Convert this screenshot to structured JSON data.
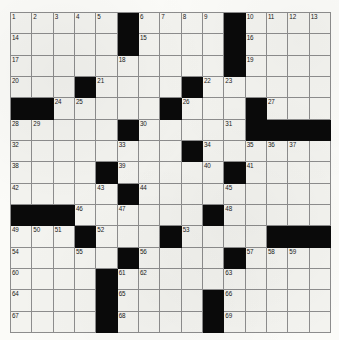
{
  "puzzle": {
    "type": "crossword-grid",
    "rows": 15,
    "cols": 15,
    "colors": {
      "block": "#0a0a0a",
      "cell": "#f3f3ef",
      "rule": "#8d8d8d",
      "paper": "#fbfbf8",
      "number_text": "#1a1a1a"
    },
    "blocks": [
      [
        0,
        5
      ],
      [
        0,
        10
      ],
      [
        1,
        5
      ],
      [
        1,
        10
      ],
      [
        2,
        10
      ],
      [
        3,
        3
      ],
      [
        3,
        8
      ],
      [
        4,
        0
      ],
      [
        4,
        1
      ],
      [
        4,
        7
      ],
      [
        4,
        11
      ],
      [
        5,
        5
      ],
      [
        5,
        11
      ],
      [
        5,
        12
      ],
      [
        5,
        13
      ],
      [
        5,
        14
      ],
      [
        6,
        8
      ],
      [
        7,
        4
      ],
      [
        7,
        10
      ],
      [
        8,
        5
      ],
      [
        9,
        0
      ],
      [
        9,
        1
      ],
      [
        9,
        2
      ],
      [
        9,
        9
      ],
      [
        10,
        3
      ],
      [
        10,
        7
      ],
      [
        10,
        12
      ],
      [
        10,
        13
      ],
      [
        10,
        14
      ],
      [
        11,
        5
      ],
      [
        11,
        10
      ],
      [
        12,
        4
      ],
      [
        13,
        4
      ],
      [
        13,
        9
      ],
      [
        14,
        4
      ],
      [
        14,
        9
      ]
    ],
    "numbers": [
      {
        "r": 0,
        "c": 0,
        "n": "1"
      },
      {
        "r": 0,
        "c": 1,
        "n": "2"
      },
      {
        "r": 0,
        "c": 2,
        "n": "3"
      },
      {
        "r": 0,
        "c": 3,
        "n": "4"
      },
      {
        "r": 0,
        "c": 4,
        "n": "5"
      },
      {
        "r": 0,
        "c": 6,
        "n": "6"
      },
      {
        "r": 0,
        "c": 7,
        "n": "7"
      },
      {
        "r": 0,
        "c": 8,
        "n": "8"
      },
      {
        "r": 0,
        "c": 9,
        "n": "9"
      },
      {
        "r": 0,
        "c": 11,
        "n": "10"
      },
      {
        "r": 0,
        "c": 12,
        "n": "11"
      },
      {
        "r": 0,
        "c": 13,
        "n": "12"
      },
      {
        "r": 0,
        "c": 14,
        "n": "13"
      },
      {
        "r": 1,
        "c": 0,
        "n": "14"
      },
      {
        "r": 1,
        "c": 6,
        "n": "15"
      },
      {
        "r": 1,
        "c": 11,
        "n": "16"
      },
      {
        "r": 2,
        "c": 0,
        "n": "17"
      },
      {
        "r": 2,
        "c": 5,
        "n": "18"
      },
      {
        "r": 2,
        "c": 11,
        "n": "19"
      },
      {
        "r": 3,
        "c": 0,
        "n": "20"
      },
      {
        "r": 3,
        "c": 4,
        "n": "21"
      },
      {
        "r": 3,
        "c": 9,
        "n": "22"
      },
      {
        "r": 3,
        "c": 10,
        "n": "23"
      },
      {
        "r": 4,
        "c": 2,
        "n": "24"
      },
      {
        "r": 4,
        "c": 3,
        "n": "25"
      },
      {
        "r": 4,
        "c": 8,
        "n": "26"
      },
      {
        "r": 4,
        "c": 12,
        "n": "27"
      },
      {
        "r": 5,
        "c": 0,
        "n": "28"
      },
      {
        "r": 5,
        "c": 1,
        "n": "29"
      },
      {
        "r": 5,
        "c": 6,
        "n": "30"
      },
      {
        "r": 5,
        "c": 10,
        "n": "31"
      },
      {
        "r": 6,
        "c": 0,
        "n": "32"
      },
      {
        "r": 6,
        "c": 5,
        "n": "33"
      },
      {
        "r": 6,
        "c": 9,
        "n": "34"
      },
      {
        "r": 6,
        "c": 11,
        "n": "35"
      },
      {
        "r": 6,
        "c": 12,
        "n": "36"
      },
      {
        "r": 6,
        "c": 13,
        "n": "37"
      },
      {
        "r": 7,
        "c": 0,
        "n": "38"
      },
      {
        "r": 7,
        "c": 5,
        "n": "39"
      },
      {
        "r": 7,
        "c": 9,
        "n": "40"
      },
      {
        "r": 7,
        "c": 11,
        "n": "41"
      },
      {
        "r": 8,
        "c": 0,
        "n": "42"
      },
      {
        "r": 8,
        "c": 4,
        "n": "43"
      },
      {
        "r": 8,
        "c": 6,
        "n": "44"
      },
      {
        "r": 8,
        "c": 10,
        "n": "45"
      },
      {
        "r": 9,
        "c": 3,
        "n": "46"
      },
      {
        "r": 9,
        "c": 5,
        "n": "47"
      },
      {
        "r": 9,
        "c": 10,
        "n": "48"
      },
      {
        "r": 10,
        "c": 0,
        "n": "49"
      },
      {
        "r": 10,
        "c": 1,
        "n": "50"
      },
      {
        "r": 10,
        "c": 2,
        "n": "51"
      },
      {
        "r": 10,
        "c": 4,
        "n": "52"
      },
      {
        "r": 10,
        "c": 8,
        "n": "53"
      },
      {
        "r": 11,
        "c": 0,
        "n": "54"
      },
      {
        "r": 11,
        "c": 3,
        "n": "55"
      },
      {
        "r": 11,
        "c": 6,
        "n": "56"
      },
      {
        "r": 11,
        "c": 11,
        "n": "57"
      },
      {
        "r": 11,
        "c": 12,
        "n": "58"
      },
      {
        "r": 11,
        "c": 13,
        "n": "59"
      },
      {
        "r": 12,
        "c": 0,
        "n": "60"
      },
      {
        "r": 12,
        "c": 5,
        "n": "61"
      },
      {
        "r": 12,
        "c": 6,
        "n": "62"
      },
      {
        "r": 12,
        "c": 10,
        "n": "63"
      },
      {
        "r": 13,
        "c": 0,
        "n": "64"
      },
      {
        "r": 13,
        "c": 5,
        "n": "65"
      },
      {
        "r": 13,
        "c": 10,
        "n": "66"
      },
      {
        "r": 14,
        "c": 0,
        "n": "67"
      },
      {
        "r": 14,
        "c": 5,
        "n": "68"
      },
      {
        "r": 14,
        "c": 10,
        "n": "69"
      }
    ],
    "letters": []
  }
}
